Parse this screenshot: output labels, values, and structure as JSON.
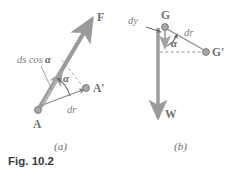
{
  "figure": {
    "number_label": "Fig. 10.2",
    "panels": [
      {
        "id": "a",
        "caption": "(a)",
        "labels": {
          "force_vector": "F",
          "point_start": "A",
          "point_end": "A'",
          "displacement": "dr",
          "projection": "ds cos",
          "projection_symbol": "α",
          "angle": "α"
        }
      },
      {
        "id": "b",
        "caption": "(b)",
        "labels": {
          "weight_vector": "W",
          "point_start": "G",
          "point_end": "G'",
          "displacement": "dr",
          "vertical_drop": "dy",
          "angle": "α"
        }
      }
    ]
  },
  "colors": {
    "arrow_gray": "#9a9a9a",
    "line_gray": "#8c8c8c",
    "dashed_gray": "#9a9a9a",
    "dot_fill": "#a8a8a8",
    "dot_stroke": "#7a7a7a",
    "text_gray": "#6f6f6f",
    "text_dark": "#3a3a3a",
    "background": "#ffffff"
  }
}
